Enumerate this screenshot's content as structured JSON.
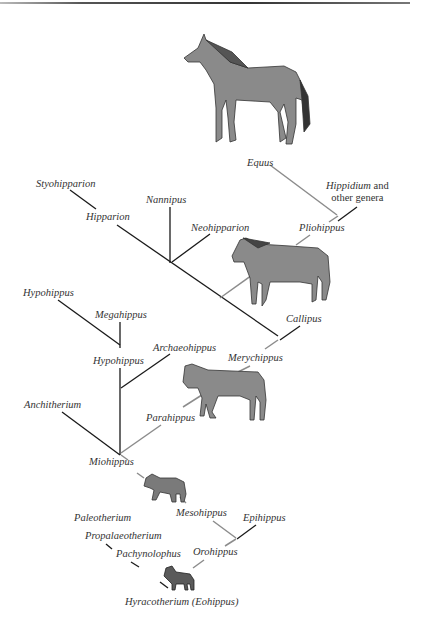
{
  "figure": {
    "colors": {
      "black_branch": "#1a1a1a",
      "gray_branch": "#8c8c8c",
      "horse_fill": "#8a8a8a"
    },
    "taxa": {
      "equus": "Equus",
      "hippidium": "Hippidium",
      "hippidium_suffix_line1": " and",
      "hippidium_line2": "other genera",
      "styohipparion": "Styohipparion",
      "hipparion": "Hipparion",
      "nannipus": "Nannipus",
      "neohipparion": "Neohipparion",
      "pliohippus": "Pliohippus",
      "hypohippus_top": "Hypohippus",
      "megahippus": "Megahippus",
      "callipus": "Callipus",
      "archaeohippus": "Archaeohippus",
      "hypohippus_mid": "Hypohippus",
      "merychippus": "Merychippus",
      "anchitherium": "Anchitherium",
      "parahippus": "Parahippus",
      "miohippus": "Miohippus",
      "mesohippus": "Mesohippus",
      "epihippus": "Epihippus",
      "paleotherium": "Paleotherium",
      "propalaeotherium": "Propalaeotherium",
      "pachynolophus": "Pachynolophus",
      "orohippus": "Orohippus",
      "hyracotherium": "Hyracotherium (Eohippus)"
    },
    "illustrations": [
      "equus-horse",
      "pliohippus-horse",
      "merychippus-horse",
      "mesohippus-horse",
      "hyracotherium-horse"
    ]
  }
}
